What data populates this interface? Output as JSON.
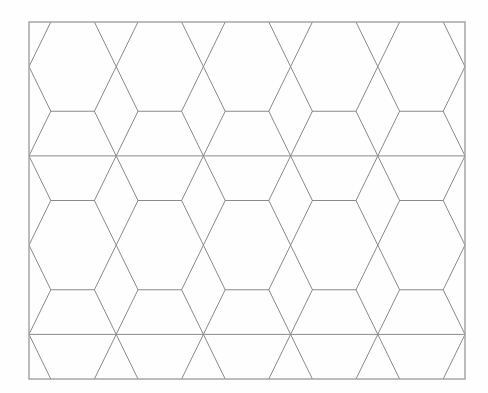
{
  "page": {
    "width": 488,
    "height": 393,
    "background": "#fefefe"
  },
  "diagram": {
    "frame": {
      "x": 29,
      "y": 22,
      "width": 436,
      "height": 357,
      "stroke": "#a0a0a0",
      "stroke_width": 1.4
    },
    "line_color": "#8a8a8a",
    "line_width": 1,
    "column_xs": [
      29,
      116.2,
      203.4,
      290.6,
      377.8,
      465
    ],
    "waist_row_ys": [
      22,
      111.25,
      200.5,
      289.75,
      379
    ],
    "crossing_row_ys": [
      66.625,
      155.875,
      245.125,
      334.375
    ],
    "full_horizontal_line_ys": [
      155.875,
      334.375
    ],
    "rhombus": {
      "half_width": 21.8,
      "half_height": 44.625
    }
  }
}
